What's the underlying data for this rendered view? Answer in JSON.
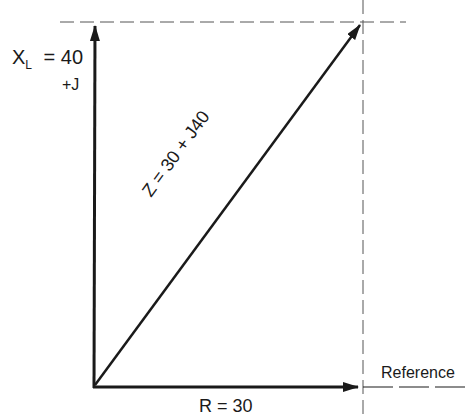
{
  "diagram": {
    "type": "impedance-phasor",
    "labels": {
      "xl_main": "X",
      "xl_sub": "L",
      "xl_value": "= 40",
      "plus_j": "+J",
      "z_vector": "Z = 30 + J40",
      "r_value": "R = 30",
      "reference": "Reference"
    },
    "vectors": [
      {
        "name": "R",
        "value": 30,
        "direction": "horizontal"
      },
      {
        "name": "XL",
        "value": 40,
        "direction": "vertical"
      },
      {
        "name": "Z",
        "real": 30,
        "imag": 40
      }
    ],
    "colors": {
      "ink": "#1a1a1a",
      "dash": "#555555",
      "background": "#ffffff"
    }
  }
}
